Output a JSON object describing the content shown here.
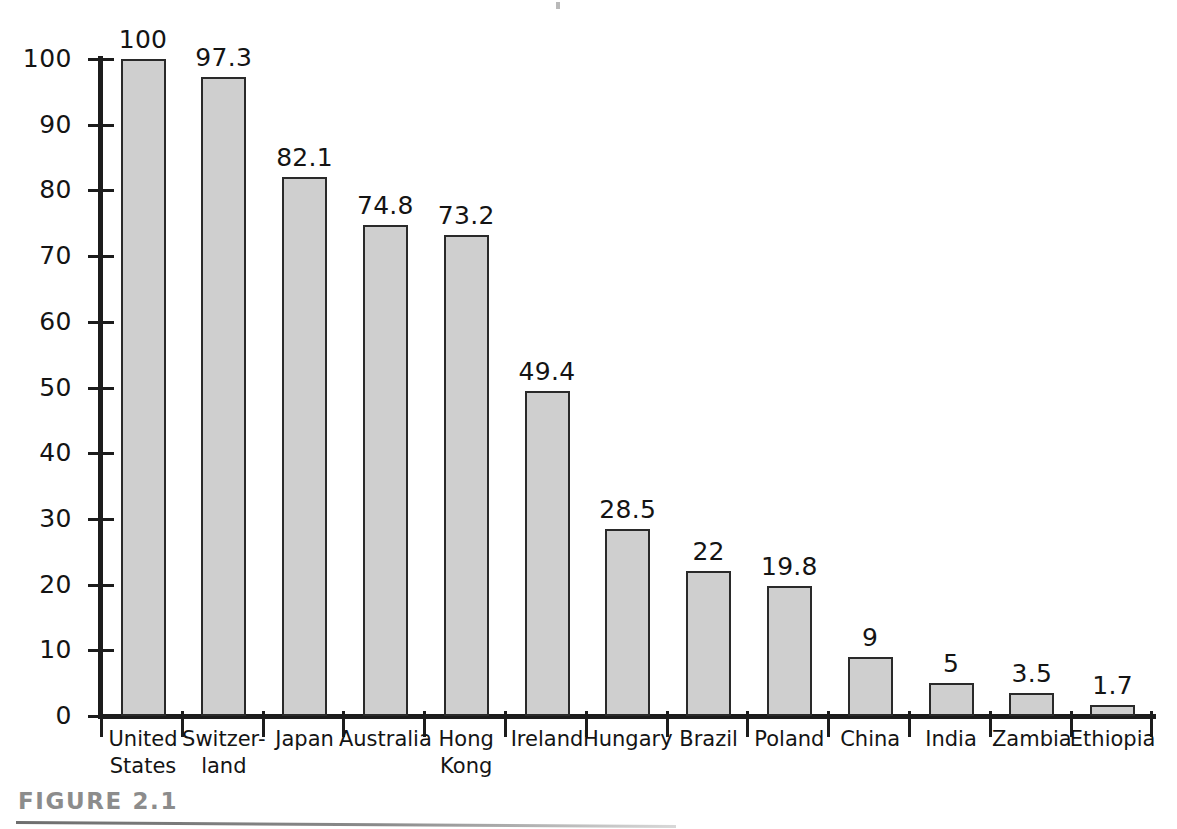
{
  "figure": {
    "caption": "FIGURE 2.1"
  },
  "chart_data": {
    "type": "bar",
    "title": "",
    "xlabel": "",
    "ylabel": "",
    "ylim": [
      0,
      100
    ],
    "grid": false,
    "legend": "none",
    "orientation": "vertical",
    "yticks": [
      0,
      10,
      20,
      30,
      40,
      50,
      60,
      70,
      80,
      90,
      100
    ],
    "ytick_labels": [
      "0",
      "10",
      "20",
      "30",
      "40",
      "50",
      "60",
      "70",
      "80",
      "90",
      "100"
    ],
    "categories": [
      "United States",
      "Switzer-land",
      "Japan",
      "Australia",
      "Hong Kong",
      "Ireland",
      "Hungary",
      "Brazil",
      "Poland",
      "China",
      "India",
      "Zambia",
      "Ethiopia"
    ],
    "category_lines": [
      [
        "United",
        "States"
      ],
      [
        "Switzer-",
        "land"
      ],
      [
        "Japan"
      ],
      [
        "Australia"
      ],
      [
        "Hong",
        "Kong"
      ],
      [
        "Ireland"
      ],
      [
        "Hungary"
      ],
      [
        "Brazil"
      ],
      [
        "Poland"
      ],
      [
        "China"
      ],
      [
        "India"
      ],
      [
        "Zambia"
      ],
      [
        "Ethiopia"
      ]
    ],
    "values": [
      100,
      97.3,
      82.1,
      74.8,
      73.2,
      49.4,
      28.5,
      22,
      19.8,
      9,
      5,
      3.5,
      1.7
    ],
    "value_labels": [
      "100",
      "97.3",
      "82.1",
      "74.8",
      "73.2",
      "49.4",
      "28.5",
      "22",
      "19.8",
      "9",
      "5",
      "3.5",
      "1.7"
    ],
    "bar_fill_color": "#cfcfcf",
    "bar_edge_color": "#2a2a2a",
    "axis_color": "#1c1c1c",
    "text_color": "#141414",
    "caption_color": "#8c8c8c"
  }
}
